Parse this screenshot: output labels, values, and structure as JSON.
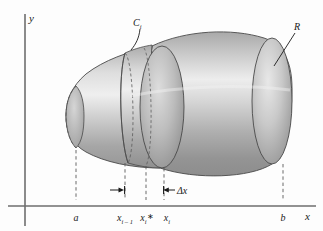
{
  "figure": {
    "name": "solid-of-revolution-disk-slice",
    "axes": {
      "y_label": "y",
      "x_label": "x"
    },
    "tick_labels": [
      {
        "name": "a",
        "base": "a",
        "sub": "",
        "star": false,
        "x": 76
      },
      {
        "name": "x-i-minus-1",
        "base": "x",
        "sub": "i – 1",
        "star": false,
        "x": 125
      },
      {
        "name": "x-i-star",
        "base": "x",
        "sub": "i",
        "star": true,
        "x": 147
      },
      {
        "name": "x-i",
        "base": "x",
        "sub": "i",
        "star": false,
        "x": 167
      },
      {
        "name": "b",
        "base": "b",
        "sub": "",
        "star": false,
        "x": 283
      }
    ],
    "annotations": {
      "delta_x": "Δx",
      "slice_label_base": "C",
      "slice_label_sub": "i",
      "region_label": "R"
    },
    "colors": {
      "background": "#fdfdfd",
      "axis": "#6e6e6e",
      "outline": "#4a4a4a",
      "dashed": "#5a5a5a",
      "text": "#1a1a1a",
      "solid_light": "#ececec",
      "solid_mid": "#b9b9b9",
      "solid_dark": "#8a8a8a",
      "cap_light": "#e2e2e2",
      "cap_dark": "#9a9a9a"
    }
  }
}
